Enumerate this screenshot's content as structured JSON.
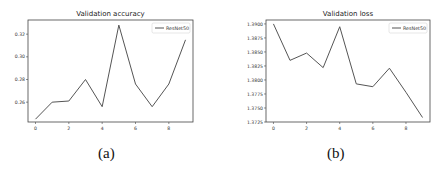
{
  "chart_data": [
    {
      "type": "line",
      "panel_label": "(a)",
      "title": "Validation accuracy",
      "xlabel": "",
      "ylabel": "",
      "x": [
        0,
        1,
        2,
        3,
        4,
        5,
        6,
        7,
        8,
        9
      ],
      "xticks": [
        0,
        2,
        4,
        6,
        8
      ],
      "yticks": [
        0.26,
        0.28,
        0.3,
        0.32
      ],
      "ytick_labels": [
        "0.26",
        "0.28",
        "0.30",
        "0.32"
      ],
      "ylim": [
        0.2425,
        0.3325
      ],
      "xlim": [
        -0.45,
        9.45
      ],
      "grid": false,
      "legend_position": "upper right",
      "series": [
        {
          "name": "ResNet50",
          "color": "#555555",
          "values": [
            0.245,
            0.26,
            0.261,
            0.28,
            0.256,
            0.328,
            0.276,
            0.256,
            0.276,
            0.315
          ]
        }
      ]
    },
    {
      "type": "line",
      "panel_label": "(b)",
      "title": "Validation loss",
      "xlabel": "",
      "ylabel": "",
      "x": [
        0,
        1,
        2,
        3,
        4,
        5,
        6,
        7,
        8,
        9
      ],
      "xticks": [
        0,
        2,
        4,
        6,
        8
      ],
      "yticks": [
        1.3725,
        1.375,
        1.3775,
        1.38,
        1.3825,
        1.385,
        1.3875,
        1.39
      ],
      "ytick_labels": [
        "1.3725",
        "1.3750",
        "1.3775",
        "1.3800",
        "1.3825",
        "1.3850",
        "1.3875",
        "1.3900"
      ],
      "ylim": [
        1.3725,
        1.3907
      ],
      "xlim": [
        -0.45,
        9.45
      ],
      "grid": false,
      "legend_position": "upper right",
      "series": [
        {
          "name": "ResNet50",
          "color": "#555555",
          "values": [
            1.39,
            1.3835,
            1.3848,
            1.3822,
            1.3895,
            1.3793,
            1.3788,
            1.3821,
            1.3778,
            1.3733
          ]
        }
      ]
    }
  ],
  "captions": {
    "a": "(a)",
    "b": "(b)"
  }
}
